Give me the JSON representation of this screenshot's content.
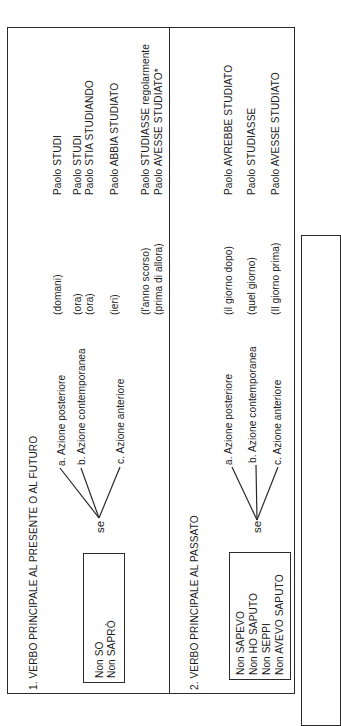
{
  "section1": {
    "title": "1. VERBO PRINCIPALE AL PRESENTE O AL FUTURO",
    "main_verbs": [
      "Non SO",
      "Non SAPRÒ"
    ],
    "connector": "se",
    "actions": [
      "a. Azione posteriore",
      "b. Azione contemporanea",
      "c. Azione anteriore"
    ],
    "time_markers": [
      "(domani)",
      "(ora)",
      "(ora)",
      "(ieri)",
      "(l'anno scorso)",
      "(prima di allora)"
    ],
    "sentences": [
      "Paolo STUDI",
      "Paolo STUDI",
      "Paolo STIA STUDIANDO",
      "Paolo  ABBIA  STUDIATO",
      "Paolo STUDIASSE regolarmente",
      "Paolo  AVESSE  STUDIATO*"
    ]
  },
  "section2": {
    "title": "2. VERBO PRINCIPALE AL PASSATO",
    "main_verbs": [
      "Non SAPEVO",
      "Non HO SAPUTO",
      "Non SEPPI",
      "Non AVEVO SAPUTO"
    ],
    "connector": "se",
    "actions": [
      "a. Azione posteriore",
      "b. Azione contemporanea",
      "c. Azione anteriore"
    ],
    "time_markers": [
      "(il giorno dopo)",
      "(quel giorno)",
      "(Il giorno prima)"
    ],
    "sentences": [
      "Paolo AVREBBE STUDIATO",
      "Paolo STUDIASSE",
      "Paolo AVESSE STUDIATO"
    ]
  },
  "page": {
    "orientation": "rotated-90-ccw",
    "ink_color": "#2a2a2a",
    "paper_color": "#ffffff"
  }
}
